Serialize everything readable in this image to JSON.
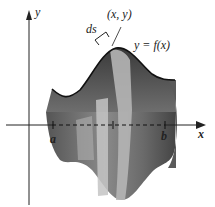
{
  "figure": {
    "labels": {
      "y_axis": "y",
      "x_axis": "x",
      "point": "(x, y)",
      "arc": "ds",
      "curve": "y = f(x)",
      "a": "a",
      "b": "b"
    },
    "colors": {
      "surface_dark": "#4a4a4a",
      "surface_mid": "#7a7a7a",
      "band_light": "#b8b8b8",
      "axis": "#222222",
      "background": "#ffffff"
    }
  }
}
